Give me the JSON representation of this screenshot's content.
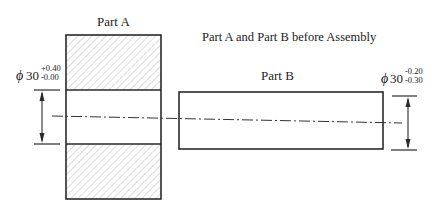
{
  "title": "Part A and Part B before Assembly",
  "part_a": {
    "label": "Part A",
    "dimension": {
      "symbol": "ϕ",
      "nominal": "30",
      "upper": "+0.40",
      "lower": "-0.00"
    }
  },
  "part_b": {
    "label": "Part B",
    "dimension": {
      "symbol": "ϕ",
      "nominal": "30",
      "upper": "-0.20",
      "lower": "-0.30"
    }
  },
  "colors": {
    "line": "#2a2a2a",
    "hatch": "#9a9a9a"
  }
}
